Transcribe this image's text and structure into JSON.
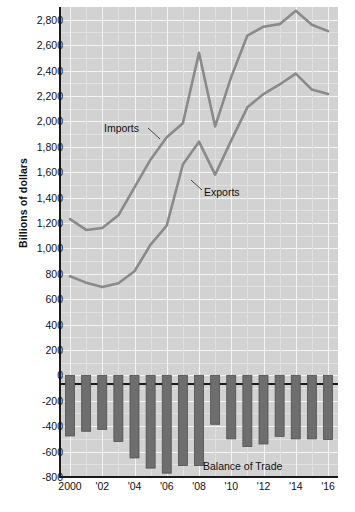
{
  "chart_data": {
    "type": "line",
    "title": "",
    "subtitle": "",
    "xlabel": "",
    "ylabel": "Billions of dollars",
    "ylim": [
      -800,
      2900
    ],
    "xlim": [
      2000,
      2016
    ],
    "grid": true,
    "legend_position": "inline-annotations",
    "x": [
      2000,
      2001,
      2002,
      2003,
      2004,
      2005,
      2006,
      2007,
      2008,
      2009,
      2010,
      2011,
      2012,
      2013,
      2014,
      2015,
      2016
    ],
    "y_tick_labels": [
      "2,800",
      "2,600",
      "2,400",
      "2,200",
      "2,000",
      "1,800",
      "1,600",
      "1,400",
      "1,200",
      "1,000",
      "800",
      "600",
      "400",
      "200",
      "0",
      "-200",
      "-400",
      "-600",
      "-800"
    ],
    "y_tick_values": [
      2800,
      2600,
      2400,
      2200,
      2000,
      1800,
      1600,
      1400,
      1200,
      1000,
      800,
      600,
      400,
      200,
      0,
      -200,
      -400,
      -600,
      -800
    ],
    "x_tick_labels": [
      "2000",
      "'02",
      "'04",
      "'06",
      "'08",
      "'10",
      "'12",
      "'14",
      "'16"
    ],
    "x_tick_values": [
      2000,
      2002,
      2004,
      2006,
      2008,
      2010,
      2012,
      2014,
      2016
    ],
    "series": [
      {
        "name": "Imports",
        "type": "line",
        "color": "#8a8a8a",
        "values": [
          1230,
          1145,
          1160,
          1260,
          1480,
          1700,
          1875,
          1985,
          2540,
          1960,
          2350,
          2675,
          2745,
          2765,
          2870,
          2760,
          2710
        ]
      },
      {
        "name": "Exports",
        "type": "line",
        "color": "#8a8a8a",
        "values": [
          780,
          730,
          695,
          725,
          820,
          1030,
          1180,
          1660,
          1840,
          1580,
          1850,
          2110,
          2215,
          2290,
          2375,
          2250,
          2215
        ]
      },
      {
        "name": "Balance of Trade",
        "type": "bar",
        "color": "#6e6e6e",
        "values": [
          -477,
          -440,
          -425,
          -520,
          -650,
          -730,
          -770,
          -710,
          -710,
          -385,
          -500,
          -560,
          -540,
          -480,
          -500,
          -500,
          -505
        ]
      }
    ],
    "annotations": [
      {
        "label": "Imports",
        "x": 2003,
        "y": 2150
      },
      {
        "label": "Exports",
        "x": 2010,
        "y": 1760
      },
      {
        "label": "Balance of Trade",
        "x": 2011,
        "y": -680
      }
    ],
    "colors": {
      "plot_background": "#d2d2d2",
      "gridline": "#f4f4f4",
      "gridline_minor": "#e0e0e0",
      "axis": "#1a1a1a",
      "line": "#8a8a8a",
      "bar": "#6e6e6e",
      "text": "#111111"
    }
  }
}
